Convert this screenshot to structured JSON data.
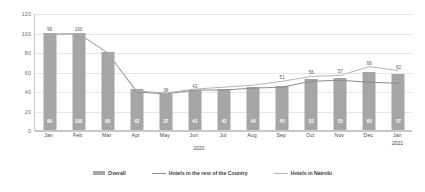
{
  "chart_data": {
    "type": "bar",
    "title": "",
    "subtitle": "",
    "xlabel": "",
    "ylabel": "",
    "ylim": [
      0,
      120
    ],
    "yticks": [
      0,
      20,
      40,
      60,
      80,
      100,
      120
    ],
    "grid": true,
    "legend_position": "bottom",
    "categories": [
      "Jan",
      "Feb",
      "Mar",
      "Apr",
      "May",
      "Jun",
      "Jul",
      "Aug",
      "Sep",
      "Oct",
      "Nov",
      "Dec",
      "Jan"
    ],
    "category_years": [
      "",
      "",
      "",
      "",
      "",
      "",
      "",
      "",
      "",
      "",
      "",
      "",
      "2021"
    ],
    "group_label_2020": "2020",
    "series": [
      {
        "name": "Overall",
        "type": "bar",
        "color": "#a6a6a6",
        "values": [
          99,
          100,
          80,
          42,
          37,
          41,
          42,
          44,
          45,
          52,
          53,
          60,
          57
        ],
        "labels": [
          "99",
          "100",
          "80",
          "42",
          "37",
          "41",
          "42",
          "44",
          "45",
          "52",
          "53",
          "60",
          "57"
        ]
      },
      {
        "name": "Hotels in the rest of the Country",
        "type": "line",
        "color": "#8c8c8c",
        "values": [
          99,
          100,
          80,
          40,
          38,
          42,
          42,
          44,
          45,
          51,
          52,
          50,
          49
        ],
        "labels": [
          "",
          "",
          "",
          "",
          "38",
          "42",
          "",
          "",
          "",
          "",
          "",
          "",
          ""
        ]
      },
      {
        "name": "Hotels in Nairobi",
        "type": "line",
        "color": "#b5b5b5",
        "values": [
          99,
          100,
          80,
          41,
          39,
          43,
          45,
          47,
          51,
          56,
          57,
          66,
          62
        ],
        "labels": [
          "",
          "",
          "",
          "",
          "",
          "",
          "",
          "",
          "51",
          "56",
          "57",
          "66",
          "62"
        ]
      }
    ],
    "top_bar_labels": [
      "99",
      "100",
      "",
      "",
      "",
      "",
      "",
      "",
      "",
      "",
      "",
      "",
      ""
    ]
  },
  "legend": {
    "items": [
      {
        "label": "Overall",
        "marker": "bar-swatch"
      },
      {
        "label": "Hotels in the rest of the Country",
        "marker": "line-swatch"
      },
      {
        "label": "Hotels in Nairobi",
        "marker": "line-swatch-light"
      }
    ]
  },
  "axis": {
    "y_tick_labels": [
      "0",
      "20",
      "40",
      "60",
      "80",
      "100",
      "120"
    ]
  }
}
